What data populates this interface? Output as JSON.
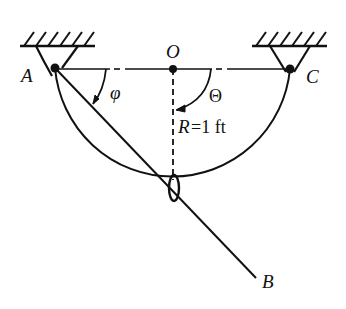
{
  "diagram": {
    "labels": {
      "point_a": "A",
      "point_o": "O",
      "point_c": "C",
      "point_b": "B",
      "angle_phi": "φ",
      "angle_theta": "Θ",
      "radius_symbol": "R",
      "radius_value": "=1 ft"
    },
    "geometry": {
      "pivot_a": [
        55,
        68
      ],
      "center_o": [
        173,
        69
      ],
      "pivot_c": [
        290,
        69
      ],
      "ring": [
        174,
        188
      ],
      "rod_end_b": [
        256,
        278
      ],
      "radius_px": 118
    },
    "colors": {
      "ink": "#111111",
      "background": "#ffffff"
    }
  }
}
